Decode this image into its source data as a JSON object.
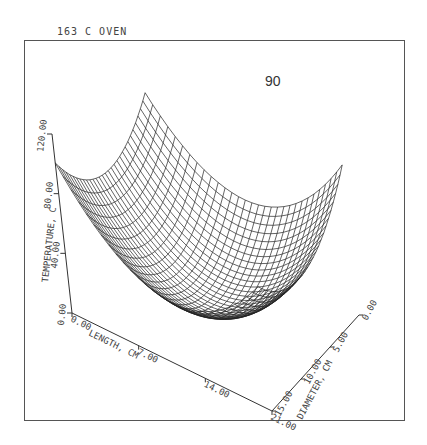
{
  "header": {
    "title": "163 C  OVEN"
  },
  "panel_label": "90",
  "chart_data": {
    "type": "surface-3d-wireframe",
    "title": "163 C  OVEN",
    "annotation": "90",
    "xlabel": "LENGTH, CM",
    "ylabel": "DIAMETER, CM",
    "zlabel": "TEMPERATURE, C",
    "x_ticks": [
      "0.00",
      "7.00",
      "14.00",
      "21.00"
    ],
    "y_ticks": [
      "0.00",
      "5.00",
      "10.00",
      "15.00"
    ],
    "z_ticks": [
      "0.00",
      "40.00",
      "80.00",
      "120.00"
    ],
    "xlim": [
      0,
      21
    ],
    "ylim": [
      0,
      15
    ],
    "zlim": [
      0,
      120
    ],
    "grid_resolution": [
      30,
      30
    ],
    "surface_description": "Bowl-shaped temperature field: minimum ~12 C near center (length ~10.5 cm, diameter ~7.5 cm), rising to ~75-90 C at the corners",
    "approx_values": {
      "center": 12,
      "corner_length0_diam0": 74,
      "corner_length0_diam15": 90,
      "corner_length21_diam0": 90
    }
  }
}
